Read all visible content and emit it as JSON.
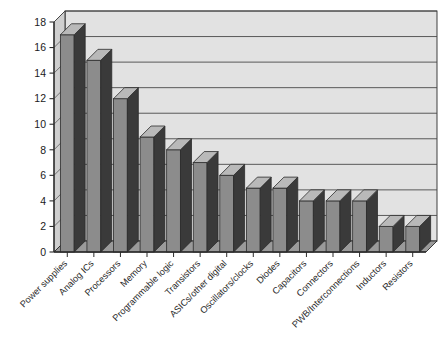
{
  "chart_data": {
    "type": "bar",
    "title": "",
    "subtitle": "",
    "xlabel": "",
    "ylabel": "",
    "ylim": [
      0,
      18
    ],
    "ytick_step": 2,
    "yticks": [
      0,
      2,
      4,
      6,
      8,
      10,
      12,
      14,
      16,
      18
    ],
    "grid": true,
    "legend": false,
    "legend_position": "none",
    "style": "3d-column-grayscale",
    "xtick_rotation_degrees": 45,
    "categories": [
      "Power supplies",
      "Analog ICs",
      "Processors",
      "Memory",
      "Programmable logic",
      "Transistors",
      "ASICs/other digital",
      "Oscillators/clocks",
      "Diodes",
      "Capacitors",
      "Connectors",
      "PWB/Interconnections",
      "Inductors",
      "Resistors"
    ],
    "values": [
      17,
      15,
      12,
      9,
      8,
      7,
      6,
      5,
      5,
      4,
      4,
      4,
      2,
      2
    ],
    "colors": {
      "bar_front": "#8c8c8c",
      "bar_side": "#3a3a3a",
      "bar_top": "#b9b9b9",
      "plot_background": "#e2e2e2",
      "wall_side": "#cfcfcf",
      "floor": "#9a9a9a",
      "gridline": "#4a4a4a",
      "axis": "#2b2b2b",
      "text": "#1a1a1a",
      "page_background": "#ffffff"
    }
  }
}
